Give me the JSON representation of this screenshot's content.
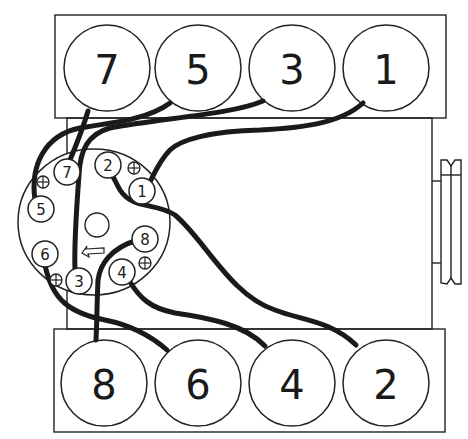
{
  "diagram": {
    "type": "firing-order-wiring-diagram",
    "top_bank": {
      "cylinders": [
        {
          "label": "7",
          "cx": 107,
          "cy": 68
        },
        {
          "label": "5",
          "cx": 198,
          "cy": 68
        },
        {
          "label": "3",
          "cx": 292,
          "cy": 68
        },
        {
          "label": "1",
          "cx": 386,
          "cy": 68
        }
      ]
    },
    "bottom_bank": {
      "cylinders": [
        {
          "label": "8",
          "cx": 104,
          "cy": 383
        },
        {
          "label": "6",
          "cx": 198,
          "cy": 383
        },
        {
          "label": "4",
          "cx": 292,
          "cy": 383
        },
        {
          "label": "2",
          "cx": 386,
          "cy": 383
        }
      ]
    },
    "distributor": {
      "rotation": "counterclockwise",
      "terminals": [
        {
          "label": "7",
          "cx": 67,
          "cy": 172
        },
        {
          "label": "2",
          "cx": 108,
          "cy": 165
        },
        {
          "label": "1",
          "cx": 142,
          "cy": 191
        },
        {
          "label": "5",
          "cx": 41,
          "cy": 209
        },
        {
          "label": "8",
          "cx": 145,
          "cy": 239
        },
        {
          "label": "6",
          "cx": 45,
          "cy": 254
        },
        {
          "label": "4",
          "cx": 122,
          "cy": 272
        },
        {
          "label": "3",
          "cx": 79,
          "cy": 281
        }
      ],
      "mount_markers": [
        "plus-icon",
        "plus-icon",
        "plus-icon",
        "plus-icon"
      ]
    }
  }
}
